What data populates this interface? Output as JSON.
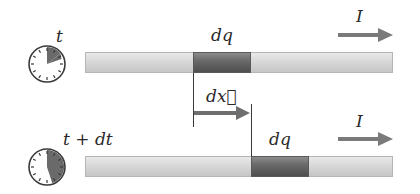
{
  "diagram": {
    "colors": {
      "wire": "#d4d4d4",
      "charge_segment": "#5e5e5e",
      "arrow": "#7a7a7a",
      "clock_elapsed": "#6a6a6a",
      "text": "#2a2a2a"
    },
    "top_row": {
      "time_label": "t",
      "charge_label": "dq",
      "current_label": "I",
      "clock_elapsed_fraction": 0.12
    },
    "displacement": {
      "label": "dx⃗"
    },
    "bottom_row": {
      "time_label": "t + dt",
      "charge_label": "dq",
      "current_label": "I",
      "clock_elapsed_fraction": 0.45
    }
  }
}
